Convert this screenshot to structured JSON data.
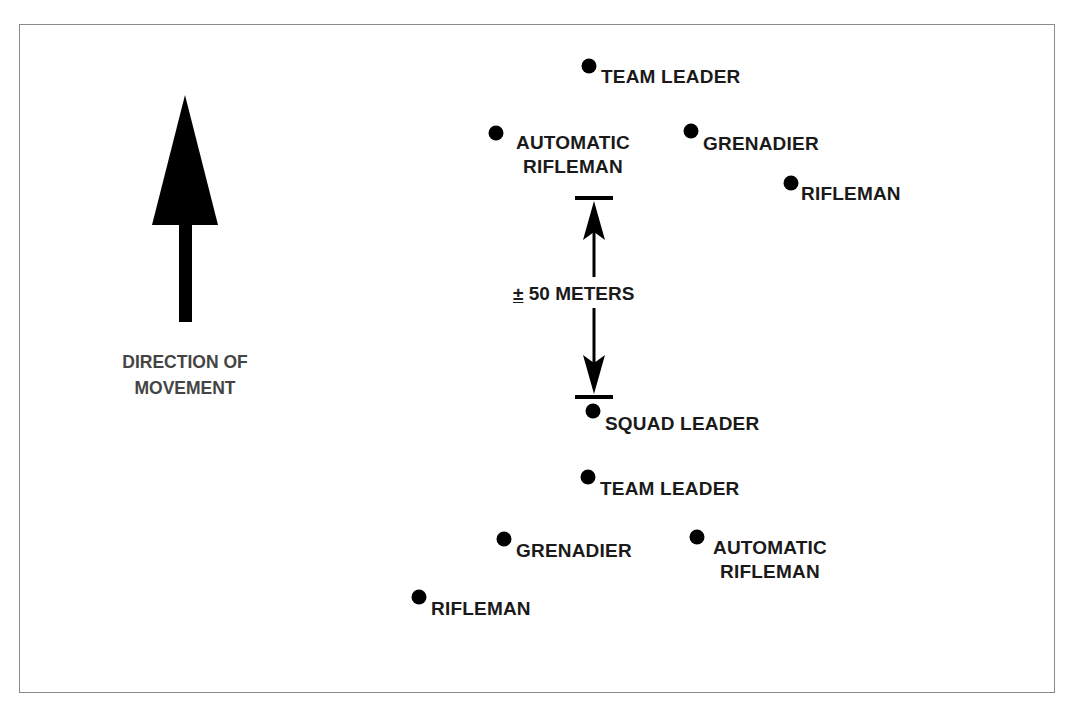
{
  "diagram": {
    "type": "squad-formation",
    "direction_label": {
      "line1": "DIRECTION OF",
      "line2": "MOVEMENT"
    },
    "distance": {
      "symbol": "±",
      "value": "50 METERS"
    },
    "positions": {
      "front_team_leader": {
        "label": "TEAM LEADER",
        "x": 589,
        "y": 66
      },
      "front_automatic_rifleman": {
        "line1": "AUTOMATIC",
        "line2": "RIFLEMAN",
        "x": 496,
        "y": 133
      },
      "front_grenadier": {
        "label": "GRENADIER",
        "x": 691,
        "y": 131
      },
      "front_rifleman": {
        "label": "RIFLEMAN",
        "x": 791,
        "y": 183
      },
      "squad_leader": {
        "label": "SQUAD LEADER",
        "x": 593,
        "y": 411
      },
      "rear_team_leader": {
        "label": "TEAM LEADER",
        "x": 588,
        "y": 477
      },
      "rear_grenadier": {
        "label": "GRENADIER",
        "x": 504,
        "y": 539
      },
      "rear_automatic_rifleman": {
        "line1": "AUTOMATIC",
        "line2": "RIFLEMAN",
        "x": 697,
        "y": 537
      },
      "rear_rifleman": {
        "label": "RIFLEMAN",
        "x": 419,
        "y": 597
      }
    },
    "colors": {
      "ink": "#000000",
      "label_text": "#1a1a1a",
      "direction_text": "#444444",
      "frame_border": "#8a8a8a"
    }
  }
}
